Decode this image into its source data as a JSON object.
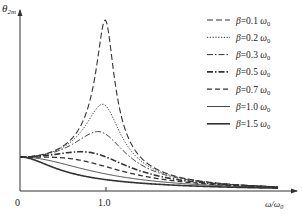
{
  "chart_data": {
    "type": "line",
    "title": "",
    "xlabel": "ω/ω0",
    "ylabel": "θ2m",
    "x_ticks": [
      {
        "value": 0,
        "label": "0"
      },
      {
        "value": 1.0,
        "label": "1.0"
      }
    ],
    "xlim": [
      0,
      3.2
    ],
    "ylim": [
      0,
      5.2
    ],
    "grid": false,
    "legend_position": "upper right",
    "formula_note": "Amplitude response θ2m ∝ 1/sqrt((1-r²)² + (2βr/ω0)²), r = ω/ω0",
    "series": [
      {
        "name": "β=0.1 ω0",
        "beta": 0.1,
        "style": "long-dash",
        "peak_x": 0.99,
        "peak_y": 5.03
      },
      {
        "name": "β=0.2 ω0",
        "beta": 0.2,
        "style": "dotted",
        "peak_x": 0.96,
        "peak_y": 2.55
      },
      {
        "name": "β=0.3 ω0",
        "beta": 0.3,
        "style": "dash-dot",
        "peak_x": 0.91,
        "peak_y": 1.75
      },
      {
        "name": "β=0.5 ω0",
        "beta": 0.5,
        "style": "dash-dot-bold",
        "peak_x": 0.71,
        "peak_y": 1.15
      },
      {
        "name": "β=0.7 ω0",
        "beta": 0.7,
        "style": "dashed",
        "peak_x": 0.14,
        "peak_y": 1.0
      },
      {
        "name": "β=1.0 ω0",
        "beta": 1.0,
        "style": "solid-thin",
        "peak_x": 0,
        "peak_y": 1.0
      },
      {
        "name": "β=1.5 ω0",
        "beta": 1.5,
        "style": "solid-bold",
        "peak_x": 0,
        "peak_y": 1.0
      }
    ]
  },
  "axes": {
    "y_label_main": "θ",
    "y_label_sub": "2m",
    "x_label_main": "ω/ω",
    "x_label_sub": "0",
    "tick_zero": "0",
    "tick_one": "1.0"
  },
  "legend": [
    {
      "prefix": "β=0.1 ",
      "omega": "ω",
      "sub": "0"
    },
    {
      "prefix": "β=0.2 ",
      "omega": "ω",
      "sub": "0"
    },
    {
      "prefix": "β=0.3 ",
      "omega": "ω",
      "sub": "0"
    },
    {
      "prefix": "β=0.5 ",
      "omega": "ω",
      "sub": "0"
    },
    {
      "prefix": "β=0.7 ",
      "omega": "ω",
      "sub": "0"
    },
    {
      "prefix": "β=1.0 ",
      "omega": "ω",
      "sub": "0"
    },
    {
      "prefix": "β=1.5 ",
      "omega": "ω",
      "sub": "0"
    }
  ]
}
